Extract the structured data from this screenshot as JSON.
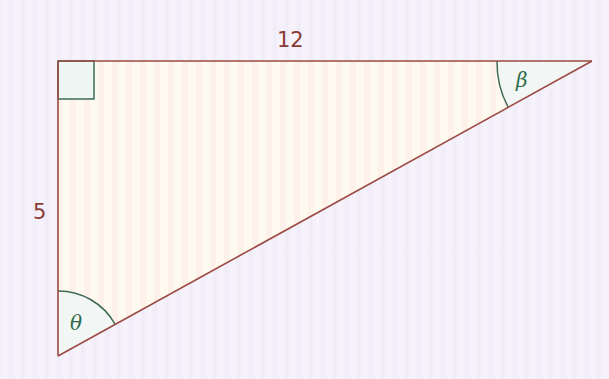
{
  "diagram": {
    "type": "right-triangle",
    "labels": {
      "top_side": "12",
      "left_side": "5",
      "angle_top_right": "β",
      "angle_bottom_left": "θ"
    },
    "vertices": {
      "right_angle": [
        58,
        61
      ],
      "top_right": [
        592,
        61
      ],
      "bottom_left": [
        58,
        356
      ]
    },
    "colors": {
      "edge": "#9b4a42",
      "fill": "#fdf6ec",
      "arc": "#3d6b55",
      "right_angle_fill": "#eef7f4",
      "label_text": "#8a3b34",
      "greek_text": "#2e6b4a"
    }
  }
}
